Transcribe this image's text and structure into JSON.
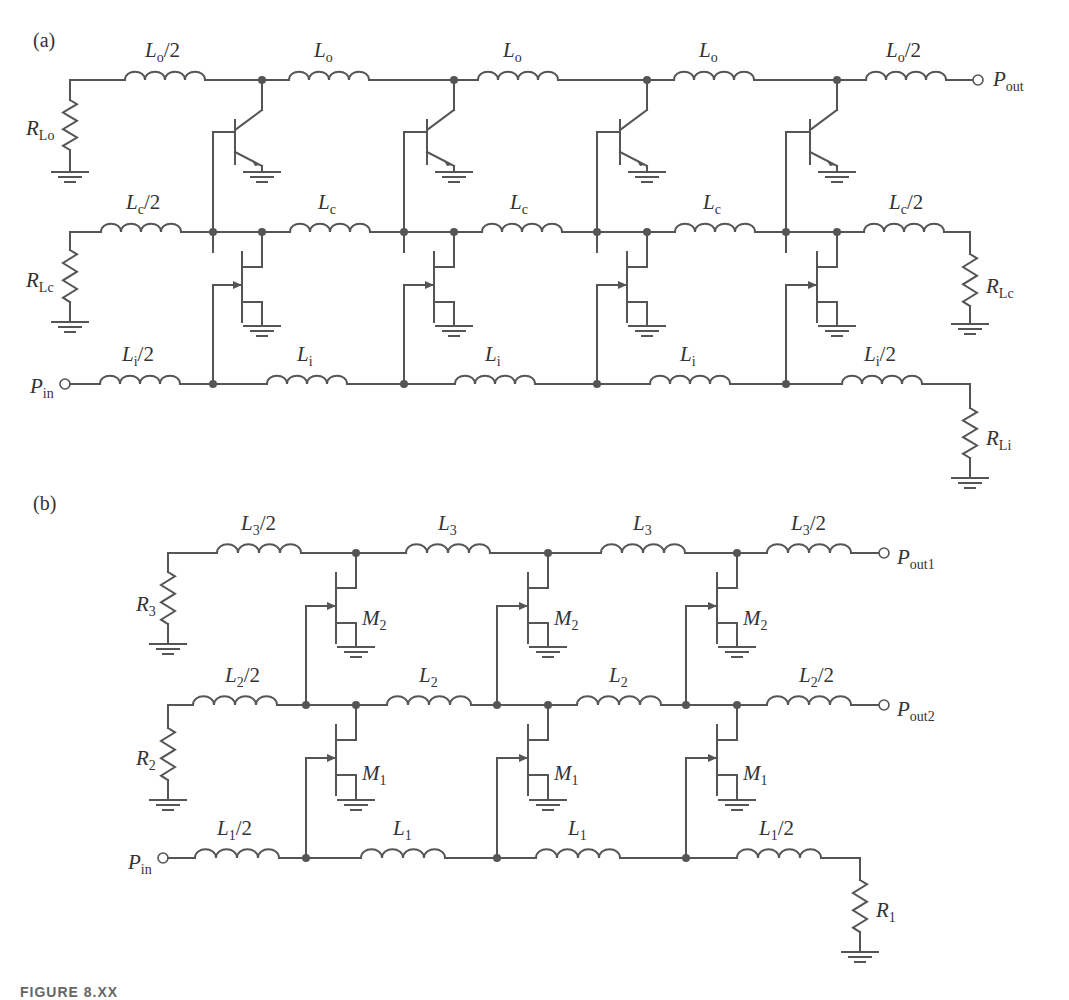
{
  "figure": {
    "caption_partial": "FIGURE 8.XX",
    "stroke_color": "#555555",
    "text_color": "#333333"
  },
  "part_a": {
    "label": "(a)",
    "device_type": "BJT",
    "stages": 4,
    "output_line": {
      "inductors": [
        {
          "sym": "L",
          "sub": "o",
          "suffix": "/2"
        },
        {
          "sym": "L",
          "sub": "o",
          "suffix": ""
        },
        {
          "sym": "L",
          "sub": "o",
          "suffix": ""
        },
        {
          "sym": "L",
          "sub": "o",
          "suffix": ""
        },
        {
          "sym": "L",
          "sub": "o",
          "suffix": "/2"
        }
      ],
      "termination": {
        "sym": "R",
        "sub": "Lo"
      },
      "port": {
        "sym": "P",
        "sub": "out"
      }
    },
    "cascode_line": {
      "inductors": [
        {
          "sym": "L",
          "sub": "c",
          "suffix": "/2"
        },
        {
          "sym": "L",
          "sub": "c",
          "suffix": ""
        },
        {
          "sym": "L",
          "sub": "c",
          "suffix": ""
        },
        {
          "sym": "L",
          "sub": "c",
          "suffix": ""
        },
        {
          "sym": "L",
          "sub": "c",
          "suffix": "/2"
        }
      ],
      "termination_left": {
        "sym": "R",
        "sub": "Lc"
      },
      "termination_right": {
        "sym": "R",
        "sub": "Lc"
      }
    },
    "input_line": {
      "inductors": [
        {
          "sym": "L",
          "sub": "i",
          "suffix": "/2"
        },
        {
          "sym": "L",
          "sub": "i",
          "suffix": ""
        },
        {
          "sym": "L",
          "sub": "i",
          "suffix": ""
        },
        {
          "sym": "L",
          "sub": "i",
          "suffix": ""
        },
        {
          "sym": "L",
          "sub": "i",
          "suffix": "/2"
        }
      ],
      "port": {
        "sym": "P",
        "sub": "in"
      },
      "termination": {
        "sym": "R",
        "sub": "Li"
      }
    }
  },
  "part_b": {
    "label": "(b)",
    "device_type": "FET",
    "stages": 3,
    "line3": {
      "inductors": [
        {
          "sym": "L",
          "sub": "3",
          "suffix": "/2"
        },
        {
          "sym": "L",
          "sub": "3",
          "suffix": ""
        },
        {
          "sym": "L",
          "sub": "3",
          "suffix": ""
        },
        {
          "sym": "L",
          "sub": "3",
          "suffix": "/2"
        }
      ],
      "termination": {
        "sym": "R",
        "sub": "3"
      },
      "port": {
        "sym": "P",
        "sub": "out1"
      },
      "device": {
        "sym": "M",
        "sub": "2"
      }
    },
    "line2": {
      "inductors": [
        {
          "sym": "L",
          "sub": "2",
          "suffix": "/2"
        },
        {
          "sym": "L",
          "sub": "2",
          "suffix": ""
        },
        {
          "sym": "L",
          "sub": "2",
          "suffix": ""
        },
        {
          "sym": "L",
          "sub": "2",
          "suffix": "/2"
        }
      ],
      "termination": {
        "sym": "R",
        "sub": "2"
      },
      "port": {
        "sym": "P",
        "sub": "out2"
      },
      "device": {
        "sym": "M",
        "sub": "1"
      }
    },
    "line1": {
      "inductors": [
        {
          "sym": "L",
          "sub": "1",
          "suffix": "/2"
        },
        {
          "sym": "L",
          "sub": "1",
          "suffix": ""
        },
        {
          "sym": "L",
          "sub": "1",
          "suffix": ""
        },
        {
          "sym": "L",
          "sub": "1",
          "suffix": "/2"
        }
      ],
      "port": {
        "sym": "P",
        "sub": "in"
      },
      "termination": {
        "sym": "R",
        "sub": "1"
      }
    }
  }
}
